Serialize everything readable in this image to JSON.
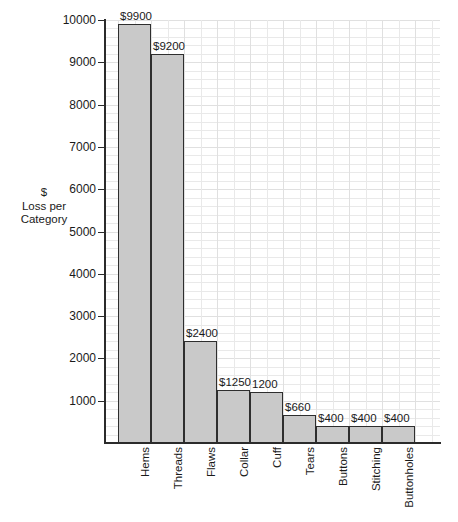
{
  "chart_data": {
    "type": "bar",
    "title": "",
    "xlabel": "",
    "ylabel": "$\nLoss per\nCategory",
    "ylabel_lines": [
      "$",
      "Loss per",
      "Category"
    ],
    "categories": [
      "Hems",
      "Threads",
      "Flaws",
      "Collar",
      "Cuff",
      "Tears",
      "Buttons",
      "Stitching",
      "Buttonholes"
    ],
    "values": [
      9900,
      9200,
      2400,
      1250,
      1200,
      660,
      400,
      400,
      400
    ],
    "data_labels": [
      "$9900",
      "$9200",
      "$2400",
      "$1250",
      "1200",
      "$660",
      "$400",
      "$400",
      "$400"
    ],
    "ylim": [
      0,
      10000
    ],
    "y_ticks": [
      1000,
      2000,
      3000,
      4000,
      5000,
      6000,
      7000,
      8000,
      9000,
      10000
    ],
    "y_tick_labels": [
      "1000",
      "2000",
      "3000",
      "4000",
      "5000",
      "6000",
      "7000",
      "8000",
      "9000",
      "10000"
    ],
    "y_minor_step": 200,
    "grid": true,
    "legend": null,
    "bar_fill_color": "#c9c9c9",
    "bar_border_color": "#2e2e2e",
    "grid_color": "#e9e9e9",
    "axis_color": "#2b2b2b",
    "background_color": "#ffffff"
  }
}
